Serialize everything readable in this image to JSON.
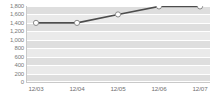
{
  "chart_data": {
    "type": "line",
    "title": "",
    "xlabel": "",
    "ylabel": "",
    "categories": [
      "12/03",
      "12/04",
      "12/05",
      "12/06",
      "12/07"
    ],
    "values": [
      1400,
      1400,
      1600,
      1790,
      1790
    ],
    "series": [
      {
        "name": "series-1",
        "values": [
          1400,
          1400,
          1600,
          1790,
          1790
        ]
      }
    ],
    "ylim": [
      0,
      1800
    ],
    "ytick_values": [
      0,
      200,
      400,
      600,
      800,
      1000,
      1200,
      1400,
      1600,
      1800
    ],
    "ytick_labels": [
      "0",
      "200",
      "400",
      "600",
      "800",
      "1,000",
      "1,200",
      "1,400",
      "1,600",
      "1,800"
    ],
    "grid": true,
    "grid_orientation": "horizontal",
    "legend": false,
    "legend_position": "none",
    "marker": "circle-open",
    "colors": {
      "line": "#4d4d4d",
      "marker_fill": "#ffffff",
      "marker_stroke": "#8a8a8a",
      "band": "#dedede",
      "gridline": "#ffffff",
      "axis": "#c9c9c9",
      "tick_label": "#7a7a7a",
      "background": "#ffffff"
    }
  }
}
